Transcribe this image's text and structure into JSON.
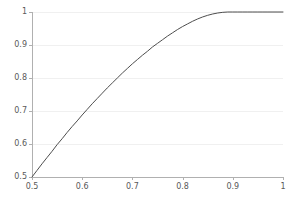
{
  "chart_data": {
    "type": "line",
    "title": "",
    "subtitle": "",
    "xlabel": "",
    "ylabel": "",
    "xlim": [
      0.5,
      1.0
    ],
    "ylim": [
      0.5,
      1.0
    ],
    "grid": true,
    "grid_axis": "y",
    "legend": "none",
    "xticks": [
      "0.5",
      "0.6",
      "0.7",
      "0.8",
      "0.9",
      "1"
    ],
    "xtick_values": [
      0.5,
      0.6,
      0.7,
      0.8,
      0.9,
      1.0
    ],
    "yticks": [
      "0.5",
      "0.6",
      "0.7",
      "0.8",
      "0.9",
      "1"
    ],
    "ytick_values": [
      0.5,
      0.6,
      0.7,
      0.8,
      0.9,
      1.0
    ],
    "series": [
      {
        "name": "curve",
        "color": "#4d4d4d",
        "linewidth": 1,
        "x": [
          0.5,
          0.51,
          0.52,
          0.53,
          0.54,
          0.55,
          0.56,
          0.57,
          0.58,
          0.59,
          0.6,
          0.61,
          0.62,
          0.63,
          0.64,
          0.65,
          0.66,
          0.67,
          0.68,
          0.69,
          0.7,
          0.71,
          0.72,
          0.73,
          0.74,
          0.75,
          0.76,
          0.77,
          0.78,
          0.79,
          0.8,
          0.81,
          0.82,
          0.83,
          0.84,
          0.85,
          0.86,
          0.87,
          0.88,
          0.89,
          0.9,
          0.91,
          0.92,
          0.93,
          0.94,
          0.95,
          0.96,
          0.97,
          0.98,
          0.99,
          1.0
        ],
        "y": [
          0.5,
          0.52,
          0.54,
          0.559,
          0.578,
          0.598,
          0.616,
          0.635,
          0.653,
          0.67,
          0.688,
          0.705,
          0.722,
          0.738,
          0.754,
          0.77,
          0.785,
          0.8,
          0.815,
          0.829,
          0.843,
          0.856,
          0.869,
          0.881,
          0.894,
          0.905,
          0.916,
          0.927,
          0.937,
          0.947,
          0.956,
          0.964,
          0.972,
          0.979,
          0.985,
          0.99,
          0.994,
          0.997,
          0.999,
          1.0,
          1.0,
          1.0,
          1.0,
          1.0,
          1.0,
          1.0,
          1.0,
          1.0,
          1.0,
          1.0,
          1.0
        ]
      }
    ]
  },
  "axes": {
    "axis_color": "#b0b0b0",
    "grid_color": "#f0f0f0",
    "tick_color": "#b0b0b0",
    "label_color": "#595959",
    "background": "#ffffff"
  }
}
